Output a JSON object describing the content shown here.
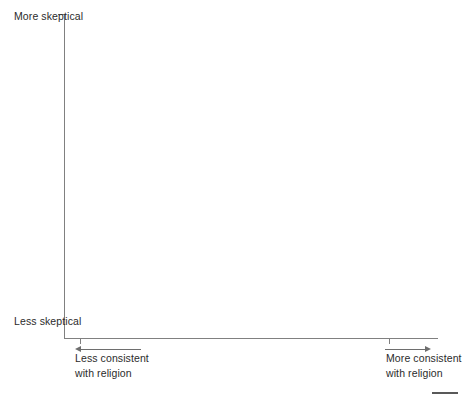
{
  "chart_data": {
    "type": "scatter",
    "title": "",
    "subtitle": "",
    "series": [],
    "x": [],
    "values": [],
    "categories": [],
    "grid": false,
    "legend": null,
    "xlabel_left": "Less consistent with religion",
    "xlabel_right": "More consistent with religion",
    "ylabel_top": "More skeptical",
    "ylabel_bottom": "Less skeptical",
    "xlim": null,
    "ylim": null,
    "xticks": [
      "",
      ""
    ],
    "yticks": [
      ""
    ],
    "annotations": [
      {
        "name": "arrow-left",
        "direction": "left",
        "meaning": "Less consistent with religion"
      },
      {
        "name": "arrow-right",
        "direction": "right",
        "meaning": "More consistent with religion"
      }
    ],
    "note": "Empty axes template: no plotted data points are rendered."
  },
  "axes": {
    "y_top_label_line1": "More",
    "y_top_label_line2": "skeptical",
    "y_bottom_label_line1": "Less",
    "y_bottom_label_line2": "skeptical",
    "x_left_caption_line1": "Less consistent",
    "x_left_caption_line2": "with religion",
    "x_right_caption_line1": "More consistent",
    "x_right_caption_line2": "with religion"
  },
  "colors": {
    "background": "#ffffff",
    "axis_line": "#808080",
    "text": "#2b2b2b",
    "arrow": "#6e6e6e",
    "footer_rule": "#595959"
  }
}
